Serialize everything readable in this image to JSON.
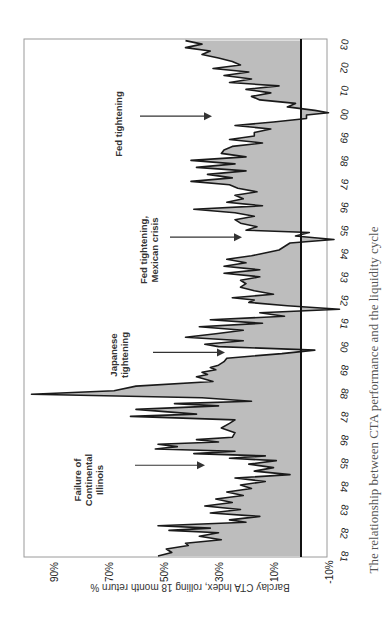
{
  "chart_data": {
    "type": "area",
    "orientation": "rotated-90-clockwise",
    "title": "",
    "ylabel": "Barclay CTA Index, rolling 18 month return %",
    "xlabel": "",
    "ylim": [
      -10,
      100
    ],
    "y_ticks": [
      "-10%",
      "10%",
      "30%",
      "50%",
      "70%",
      "90%"
    ],
    "y_tick_values": [
      -10,
      10,
      30,
      50,
      70,
      90
    ],
    "x_ticks": [
      "81",
      "82",
      "83",
      "84",
      "85",
      "86",
      "87",
      "88",
      "89",
      "90",
      "91",
      "92",
      "93",
      "94",
      "95",
      "96",
      "97",
      "98",
      "99",
      "00",
      "01",
      "02",
      "03"
    ],
    "x_tick_values": [
      1981,
      1982,
      1983,
      1984,
      1985,
      1986,
      1987,
      1988,
      1989,
      1990,
      1991,
      1992,
      1993,
      1994,
      1995,
      1996,
      1997,
      1998,
      1999,
      2000,
      2001,
      2002,
      2003
    ],
    "grid": false,
    "fill_color": "#bdbdbd",
    "line_color": "#1a1a1a",
    "series": [
      {
        "name": "Barclay CTA Index rolling 18 month return",
        "x": [
          1981.0,
          1981.15,
          1981.3,
          1981.45,
          1981.55,
          1981.7,
          1981.85,
          1982.0,
          1982.1,
          1982.2,
          1982.3,
          1982.45,
          1982.55,
          1982.7,
          1982.85,
          1983.0,
          1983.15,
          1983.3,
          1983.45,
          1983.6,
          1983.75,
          1983.9,
          1984.05,
          1984.2,
          1984.35,
          1984.5,
          1984.65,
          1984.8,
          1984.95,
          1985.1,
          1985.2,
          1985.3,
          1985.4,
          1985.5,
          1985.6,
          1985.7,
          1985.8,
          1985.9,
          1986.0,
          1986.1,
          1986.3,
          1986.5,
          1986.7,
          1986.85,
          1987.0,
          1987.1,
          1987.3,
          1987.45,
          1987.55,
          1987.65,
          1987.8,
          1987.95,
          1988.1,
          1988.3,
          1988.5,
          1988.7,
          1988.8,
          1988.9,
          1989.0,
          1989.1,
          1989.2,
          1989.35,
          1989.5,
          1989.7,
          1989.85,
          1990.0,
          1990.1,
          1990.25,
          1990.4,
          1990.55,
          1990.7,
          1990.85,
          1991.0,
          1991.15,
          1991.3,
          1991.45,
          1991.6,
          1991.75,
          1991.9,
          1992.0,
          1992.1,
          1992.25,
          1992.4,
          1992.55,
          1992.7,
          1992.85,
          1993.0,
          1993.15,
          1993.3,
          1993.45,
          1993.6,
          1993.75,
          1993.9,
          1994.0,
          1994.15,
          1994.3,
          1994.45,
          1994.6,
          1994.75,
          1994.9,
          1995.0,
          1995.15,
          1995.3,
          1995.45,
          1995.6,
          1995.75,
          1995.9,
          1996.05,
          1996.2,
          1996.35,
          1996.5,
          1996.65,
          1996.8,
          1996.95,
          1997.1,
          1997.25,
          1997.4,
          1997.55,
          1997.7,
          1997.85,
          1998.0,
          1998.15,
          1998.3,
          1998.45,
          1998.6,
          1998.75,
          1998.9,
          1999.05,
          1999.2,
          1999.35,
          1999.5,
          1999.65,
          1999.8,
          1999.95,
          2000.05,
          2000.15,
          2000.3,
          2000.45,
          2000.6,
          2000.75,
          2000.9,
          2001.05,
          2001.2,
          2001.35,
          2001.5,
          2001.65,
          2001.8,
          2001.95,
          2002.1,
          2002.25,
          2002.4,
          2002.55,
          2002.7,
          2002.85,
          2003.0,
          2003.15
        ],
        "values": [
          52,
          47,
          49,
          41,
          42,
          29,
          37,
          30,
          48,
          33,
          52,
          20,
          26,
          15,
          33,
          22,
          35,
          25,
          31,
          21,
          27,
          18,
          22,
          13,
          24,
          4,
          17,
          10,
          19,
          9,
          26,
          13,
          39,
          24,
          53,
          45,
          52,
          30,
          38,
          25,
          24,
          29,
          26,
          24,
          62,
          38,
          60,
          30,
          46,
          18,
          36,
          98,
          68,
          60,
          32,
          38,
          34,
          36,
          31,
          33,
          30,
          28,
          27,
          7,
          -5,
          30,
          35,
          21,
          42,
          31,
          21,
          37,
          14,
          33,
          6,
          15,
          -14,
          5,
          19,
          17,
          25,
          10,
          17,
          22,
          20,
          22,
          15,
          28,
          15,
          28,
          20,
          27,
          18,
          14,
          8,
          6,
          4,
          -12,
          2,
          -3,
          20,
          16,
          22,
          24,
          17,
          24,
          39,
          14,
          27,
          21,
          24,
          16,
          23,
          26,
          40,
          25,
          34,
          20,
          38,
          24,
          40,
          20,
          29,
          28,
          25,
          14,
          26,
          17,
          17,
          11,
          24,
          10,
          -2,
          -2,
          -10,
          -5,
          5,
          2,
          15,
          18,
          11,
          20,
          8,
          26,
          18,
          28,
          19,
          32,
          22,
          25,
          30,
          36,
          33,
          42,
          36,
          42
        ]
      }
    ],
    "annotations": [
      {
        "text": [
          "Failure of",
          "Continental",
          "Illinois"
        ],
        "arrow_x": 1984.9
      },
      {
        "text": [
          "Japanese",
          "tightening"
        ],
        "arrow_x": 1989.75
      },
      {
        "text": [
          "Fed tightening,",
          "Mexican crisis"
        ],
        "arrow_x": 1994.7
      },
      {
        "text": [
          "Fed tightening"
        ],
        "arrow_x": 1999.9
      }
    ]
  },
  "caption": "The relationship between CTA performance and the liquidity cycle"
}
